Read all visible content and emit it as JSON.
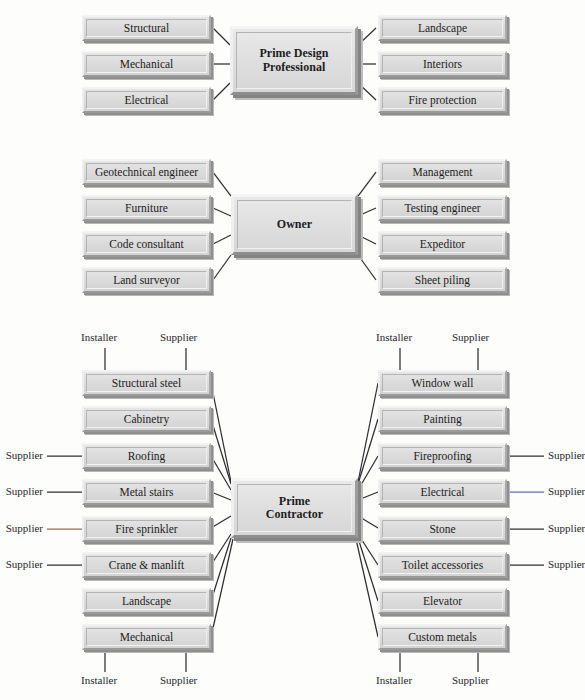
{
  "diagram": {
    "colors": {
      "page_background": "#fdfdfb",
      "box_fill": "#dcdcdc",
      "box_shadow": "#8f8f8f",
      "line": "#2f2f33",
      "text": "#1d1d22",
      "accent_blue": "#6b6bd0",
      "accent_brown": "#9a6a45"
    },
    "sections": [
      {
        "id": "prime-design-professional",
        "hub": {
          "lines": [
            "Prime Design",
            "Professional"
          ]
        },
        "left_boxes": [
          "Structural",
          "Mechanical",
          "Electrical"
        ],
        "right_boxes": [
          "Landscape",
          "Interiors",
          "Fire protection"
        ],
        "edge_tags": []
      },
      {
        "id": "owner",
        "hub": {
          "lines": [
            "Owner"
          ]
        },
        "left_boxes": [
          "Geotechnical engineer",
          "Furniture",
          "Code consultant",
          "Land surveyor"
        ],
        "right_boxes": [
          "Management",
          "Testing engineer",
          "Expeditor",
          "Sheet piling"
        ],
        "edge_tags": []
      },
      {
        "id": "prime-contractor",
        "hub": {
          "lines": [
            "Prime",
            "Contractor"
          ]
        },
        "left_boxes": [
          "Structural steel",
          "Cabinetry",
          "Roofing",
          "Metal stairs",
          "Fire sprinkler",
          "Crane & manlift",
          "Landscape",
          "Mechanical"
        ],
        "right_boxes": [
          "Window wall",
          "Painting",
          "Fireproofing",
          "Electrical",
          "Stone",
          "Toilet accessories",
          "Elevator",
          "Custom metals"
        ],
        "top_labels_left": [
          "Installer",
          "Supplier"
        ],
        "top_labels_right": [
          "Installer",
          "Supplier"
        ],
        "bottom_labels_left": [
          "Installer",
          "Supplier"
        ],
        "bottom_labels_right": [
          "Installer",
          "Supplier"
        ],
        "side_labels_left": [
          "Supplier",
          "Supplier",
          "Supplier",
          "Supplier"
        ],
        "side_labels_right": [
          "Supplier",
          "Supplier",
          "Supplier",
          "Supplier"
        ],
        "side_label_left_targets": [
          "Roofing",
          "Metal stairs",
          "Fire sprinkler",
          "Crane & manlift"
        ],
        "side_label_right_targets": [
          "Fireproofing",
          "Electrical",
          "Stone",
          "Toilet accessories"
        ]
      }
    ]
  }
}
